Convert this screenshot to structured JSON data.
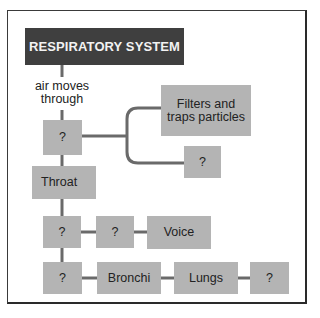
{
  "diagram": {
    "title": "RESPIRATORY SYSTEM",
    "connector_label": "air moves through",
    "connector_label_lines": [
      "air moves",
      "through"
    ],
    "nodes": {
      "nose_unknown": "?",
      "filters": "Filters and traps particles",
      "filters_lines": [
        "Filters and",
        "traps particles"
      ],
      "function_unknown": "?",
      "throat": "Throat",
      "row3_unknown_1": "?",
      "row3_unknown_2": "?",
      "voice": "Voice",
      "row4_unknown_1": "?",
      "bronchi": "Bronchi",
      "lungs": "Lungs",
      "row4_unknown_2": "?"
    },
    "colors": {
      "title_bg": "#3f3f3f",
      "title_text": "#f2f2f2",
      "box_bg": "#b4b4b4",
      "line": "#6a6a6a"
    }
  }
}
